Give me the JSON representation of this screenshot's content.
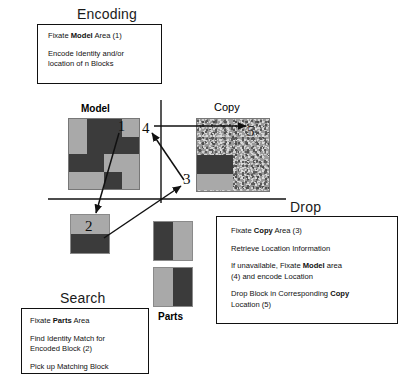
{
  "diagram": {
    "colors": {
      "light_gray": "#a9a9a9",
      "dark_gray": "#3b3b3b",
      "noise_gray": "#9a9a9a",
      "line": "#111111",
      "text": "#111111"
    }
  },
  "sections": {
    "encoding": {
      "heading": "Encoding",
      "steps": [
        {
          "pre": "Fixate ",
          "bold": "Model",
          "post": " Area (1)"
        },
        {
          "pre": "Encode Identity and/or",
          "bold": "",
          "post": ""
        },
        {
          "pre": "location of n Blocks",
          "bold": "",
          "post": ""
        }
      ]
    },
    "search": {
      "heading": "Search",
      "steps": [
        {
          "pre": "Fixate ",
          "bold": "Parts",
          "post": " Area"
        },
        {
          "pre": "Find Identity Match for",
          "bold": "",
          "post": ""
        },
        {
          "pre": "Encoded Block (2)",
          "bold": "",
          "post": ""
        },
        {
          "pre": "Pick up Matching Block",
          "bold": "",
          "post": ""
        }
      ]
    },
    "drop": {
      "heading": "Drop",
      "steps": [
        {
          "pre": "Fixate ",
          "bold": "Copy",
          "post": " Area (3)"
        },
        {
          "pre": "Retrieve Location Information",
          "bold": "",
          "post": ""
        },
        {
          "pre": "If unavailable, Fixate ",
          "bold": "Model",
          "post": " area"
        },
        {
          "pre": "(4) and encode Location",
          "bold": "",
          "post": ""
        },
        {
          "pre": "Drop Block in Corresponding ",
          "bold": "Copy",
          "post": ""
        },
        {
          "pre": "Location (5)",
          "bold": "",
          "post": ""
        }
      ]
    }
  },
  "areas": {
    "model_label": "Model",
    "copy_label": "Copy",
    "parts_label": "Parts"
  },
  "callouts": [
    {
      "id": "1",
      "label": "1"
    },
    {
      "id": "2",
      "label": "2"
    },
    {
      "id": "3",
      "label": "3"
    },
    {
      "id": "4",
      "label": "4"
    },
    {
      "id": "5",
      "label": "5"
    }
  ],
  "model_grid": {
    "rows": 4,
    "cols": 4,
    "cells": [
      "light",
      "dark",
      "dark",
      "light",
      "light",
      "dark",
      "dark",
      "dark",
      "dark",
      "dark",
      "light",
      "light",
      "light",
      "light",
      "dark",
      "light"
    ]
  },
  "copy_board": {
    "background": "noise",
    "placed_blocks": [
      {
        "name": "dark-block",
        "tone": "dark"
      },
      {
        "name": "light-block",
        "tone": "light"
      }
    ]
  },
  "held_block": {
    "name": "held-block",
    "top": "light",
    "bottom": "dark"
  },
  "parts_blocks": [
    {
      "name": "part-block-1",
      "left": "dark",
      "right": "light"
    },
    {
      "name": "part-block-2",
      "left": "light",
      "right": "dark"
    }
  ]
}
